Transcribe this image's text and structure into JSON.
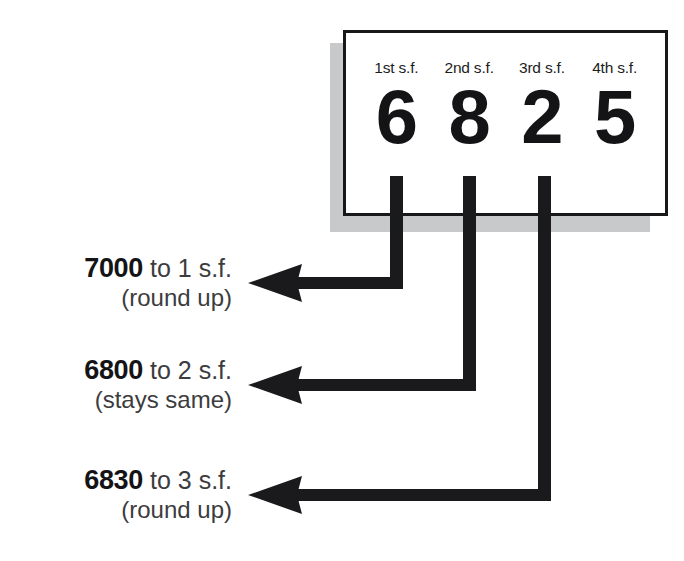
{
  "diagram": {
    "colors": {
      "ink": "#141416",
      "card_border": "#18181a",
      "card_fill": "#ffffff",
      "card_shadow": "#c8c9ca",
      "text": "#3c3c3e",
      "arrow": "#1a1a1c"
    }
  },
  "card": {
    "number": "6825",
    "columns": [
      {
        "label": "1st s.f.",
        "digit": "6"
      },
      {
        "label": "2nd s.f.",
        "digit": "8"
      },
      {
        "label": "3rd s.f.",
        "digit": "2"
      },
      {
        "label": "4th s.f.",
        "digit": "5"
      }
    ]
  },
  "results": [
    {
      "value": "7000",
      "suffix": "to 1 s.f.",
      "note": "(round up)",
      "from_digit": "6",
      "from_column": "1st s.f."
    },
    {
      "value": "6800",
      "suffix": "to 2 s.f.",
      "note": "(stays same)",
      "from_digit": "8",
      "from_column": "2nd s.f."
    },
    {
      "value": "6830",
      "suffix": "to 3 s.f.",
      "note": "(round up)",
      "from_digit": "2",
      "from_column": "3rd s.f."
    }
  ]
}
